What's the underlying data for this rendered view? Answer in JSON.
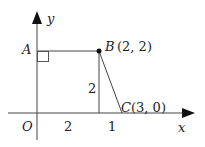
{
  "diagram": {
    "axes": {
      "x_label": "x",
      "y_label": "y",
      "origin_label": "O"
    },
    "points": {
      "A": {
        "name": "A",
        "label": ""
      },
      "B": {
        "name": "B",
        "label": "(2, 2)"
      },
      "C": {
        "name": "C",
        "label": "(3, 0)"
      }
    },
    "measurements": {
      "vertical_segment": "2",
      "x_segment_OB_foot": "2",
      "x_segment_foot_C": "1"
    },
    "colors": {
      "stroke": "#222222"
    }
  }
}
